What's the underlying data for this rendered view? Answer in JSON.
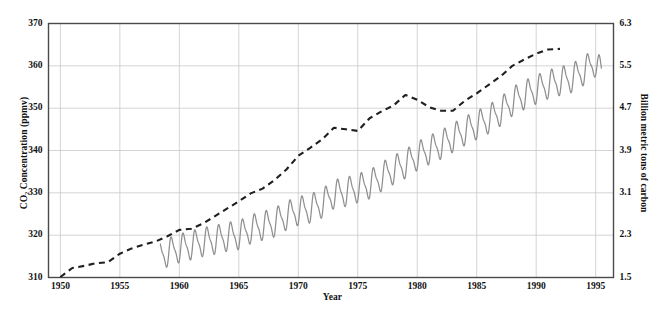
{
  "chart_data": {
    "type": "line",
    "title": "",
    "xlabel": "Year",
    "ylabel": "CO2 Concentration (ppmv)",
    "ylabel_left": "CO₂ Concentration (ppmv)",
    "ylabel_right": "Billion metric tons of carbon",
    "xlim": [
      1949,
      1996.5
    ],
    "ylim": [
      310,
      370
    ],
    "ylim_right": [
      1.5,
      6.3
    ],
    "grid": true,
    "legend_position": "none",
    "xticks": [
      1950,
      1955,
      1960,
      1965,
      1970,
      1975,
      1980,
      1985,
      1990,
      1995
    ],
    "xticklabels": [
      "1950",
      "1955",
      "1960",
      "1965",
      "1970",
      "1975",
      "1980",
      "1985",
      "1990",
      "1995"
    ],
    "yticks_left": [
      310,
      320,
      330,
      340,
      350,
      360,
      370
    ],
    "yticklabels_left": [
      "310",
      "320",
      "330",
      "340",
      "350",
      "360",
      "370"
    ],
    "yticks_right": [
      1.5,
      2.3,
      3.1,
      3.9,
      4.7,
      5.5,
      6.3
    ],
    "yticklabels_right": [
      "1.5",
      "2.3",
      "3.1",
      "3.9",
      "4.7",
      "5.5",
      "6.3"
    ],
    "series": [
      {
        "name": "Global carbon emissions",
        "axis": "right",
        "style": "dashed",
        "color": "#1f1f1f",
        "units": "Billion metric tons of carbon",
        "x": [
          1950,
          1951,
          1952,
          1953,
          1954,
          1955,
          1956,
          1957,
          1958,
          1959,
          1960,
          1961,
          1962,
          1963,
          1964,
          1965,
          1966,
          1967,
          1968,
          1969,
          1970,
          1971,
          1972,
          1973,
          1974,
          1975,
          1976,
          1977,
          1978,
          1979,
          1980,
          1981,
          1982,
          1983,
          1984,
          1985,
          1986,
          1987,
          1988,
          1989,
          1990,
          1991,
          1992
        ],
        "values": [
          1.51,
          1.68,
          1.72,
          1.77,
          1.79,
          1.95,
          2.05,
          2.12,
          2.18,
          2.28,
          2.4,
          2.42,
          2.52,
          2.66,
          2.8,
          2.94,
          3.09,
          3.18,
          3.34,
          3.54,
          3.8,
          3.95,
          4.11,
          4.33,
          4.3,
          4.27,
          4.51,
          4.64,
          4.75,
          4.95,
          4.86,
          4.72,
          4.65,
          4.65,
          4.84,
          4.98,
          5.14,
          5.3,
          5.5,
          5.62,
          5.73,
          5.81,
          5.82
        ]
      },
      {
        "name": "CO2 concentration (Mauna Loa)",
        "axis": "left",
        "style": "solid",
        "color": "#8a8a8a",
        "units": "ppmv",
        "description": "Monthly mean atmospheric CO2 with seasonal sawtooth cycle",
        "annual_x": [
          1958.4,
          1959,
          1960,
          1961,
          1962,
          1963,
          1964,
          1965,
          1966,
          1967,
          1968,
          1969,
          1970,
          1971,
          1972,
          1973,
          1974,
          1975,
          1976,
          1977,
          1978,
          1979,
          1980,
          1981,
          1982,
          1983,
          1984,
          1985,
          1986,
          1987,
          1988,
          1989,
          1990,
          1991,
          1992,
          1993,
          1994,
          1995,
          1995.5
        ],
        "annual_values": [
          315.3,
          315.9,
          316.9,
          317.6,
          318.4,
          318.9,
          319.6,
          320.0,
          321.4,
          322.2,
          323.0,
          324.6,
          325.7,
          326.3,
          327.5,
          329.7,
          330.2,
          331.1,
          332.0,
          333.8,
          335.4,
          336.8,
          338.7,
          340.1,
          341.4,
          343.0,
          344.6,
          346.0,
          347.4,
          349.2,
          351.6,
          353.1,
          354.4,
          355.6,
          356.4,
          357.1,
          358.8,
          360.9,
          358.0
        ],
        "seasonal_amplitude_ppmv": 6.0,
        "seasonal_peak_month": "May",
        "seasonal_trough_month": "September"
      }
    ],
    "annotations": []
  },
  "figure": {
    "caption_fragment": ""
  }
}
